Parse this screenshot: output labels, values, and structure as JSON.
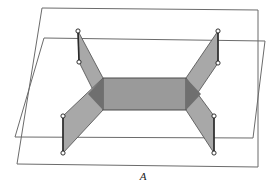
{
  "figure": {
    "label": "A",
    "label_position": {
      "x": 143,
      "y": 180
    },
    "colors": {
      "background": "#ffffff",
      "plane_outline": "#6b6b6b",
      "wing_fill": "#a8a8a8",
      "center_fill": "#9a9a9a",
      "overlap_fill": "#6f6f6f",
      "edge_dark": "#2b2b2b",
      "vertex_fill": "#ffffff",
      "vertex_stroke": "#1c1c1c",
      "label_color": "#1a1a1a"
    },
    "planes": [
      {
        "name": "outer-plane",
        "points": "42,8 258,10 258,167 17,164"
      },
      {
        "name": "inner-plane",
        "points": "44,38 265,41 253,138 15,137"
      }
    ],
    "center_panel": {
      "name": "center-rectangle",
      "points": "103,78 186,78 186,110 103,110"
    },
    "wings": [
      {
        "name": "upper-left-wing",
        "points": "78,31 103,78 103,110 79,62"
      },
      {
        "name": "upper-right-wing",
        "points": "218,31 218,63 186,110 186,78"
      },
      {
        "name": "lower-left-wing",
        "points": "63,116 103,78 103,110 63,153"
      },
      {
        "name": "lower-right-wing",
        "points": "214,116 214,153 186,110 186,78"
      }
    ],
    "overlaps": [
      {
        "name": "left-overlap-triangle",
        "points": "103,78 103,110 88,94"
      },
      {
        "name": "right-overlap-triangle",
        "points": "186,78 186,110 201,94"
      }
    ],
    "heavy_edges": [
      {
        "name": "upper-left-vertical-edge",
        "x1": 78,
        "y1": 31,
        "x2": 79,
        "y2": 62
      },
      {
        "name": "upper-right-vertical-edge",
        "x1": 218,
        "y1": 31,
        "x2": 218,
        "y2": 63
      },
      {
        "name": "lower-left-vertical-edge",
        "x1": 63,
        "y1": 116,
        "x2": 63,
        "y2": 153
      },
      {
        "name": "lower-right-vertical-edge",
        "x1": 214,
        "y1": 116,
        "x2": 214,
        "y2": 153
      }
    ],
    "vertices": [
      {
        "name": "vertex-upper-left-top",
        "x": 78,
        "y": 31
      },
      {
        "name": "vertex-upper-left-bottom",
        "x": 79,
        "y": 62
      },
      {
        "name": "vertex-upper-right-top",
        "x": 218,
        "y": 31
      },
      {
        "name": "vertex-upper-right-bottom",
        "x": 218,
        "y": 63
      },
      {
        "name": "vertex-lower-left-top",
        "x": 63,
        "y": 116
      },
      {
        "name": "vertex-lower-left-bottom",
        "x": 63,
        "y": 153
      },
      {
        "name": "vertex-lower-right-top",
        "x": 214,
        "y": 116
      },
      {
        "name": "vertex-lower-right-bottom",
        "x": 214,
        "y": 153
      }
    ],
    "vertex_radius": 2.1
  }
}
